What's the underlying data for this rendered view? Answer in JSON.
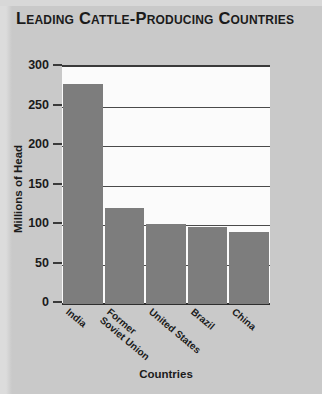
{
  "title": "Leading Cattle-Producing Countries",
  "axis_title_x": "Countries",
  "axis_title_y": "Millions of Head",
  "colors": {
    "bar": "#7d7d7d",
    "page_background": "#c9c9c9",
    "plot_background": "#fbfbfb",
    "axis": "#3a3a3a",
    "text": "#1b1b1b"
  },
  "chart_data": {
    "type": "bar",
    "title": "Leading Cattle-Producing Countries",
    "subtitle": "",
    "xlabel": "Countries",
    "ylabel": "Millions of Head",
    "categories": [
      "India",
      "Former\nSoviet Union",
      "United States",
      "Brazil",
      "China"
    ],
    "category_labels": [
      {
        "line1": "India",
        "line2": ""
      },
      {
        "line1": "Former",
        "line2": "Soviet Union"
      },
      {
        "line1": "United States",
        "line2": ""
      },
      {
        "line1": "Brazil",
        "line2": ""
      },
      {
        "line1": "China",
        "line2": ""
      }
    ],
    "values": [
      278,
      122,
      101,
      97,
      91
    ],
    "ylim": [
      0,
      300
    ],
    "yticks": [
      0,
      50,
      100,
      150,
      200,
      250,
      300
    ],
    "ytick_labels": [
      "0",
      "50",
      "100",
      "150",
      "200",
      "250",
      "300"
    ],
    "grid": true,
    "grid_axis": "y",
    "legend": false,
    "legend_position": "none"
  }
}
